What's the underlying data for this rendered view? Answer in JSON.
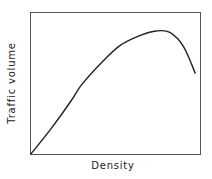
{
  "chart_data": {
    "type": "line",
    "title": "",
    "xlabel": "Density",
    "ylabel": "Traffic volume",
    "grid": false,
    "legend": null,
    "x_ticks": [],
    "y_ticks": [],
    "series": [
      {
        "name": "Traffic volume vs density",
        "x": [
          0,
          0.12,
          0.24,
          0.3,
          0.42,
          0.53,
          0.65,
          0.74,
          0.82,
          0.9,
          0.97
        ],
        "y": [
          0,
          0.18,
          0.38,
          0.49,
          0.65,
          0.77,
          0.84,
          0.87,
          0.86,
          0.76,
          0.57
        ]
      }
    ],
    "xlim": [
      0,
      1
    ],
    "ylim": [
      0,
      1
    ],
    "annotations": []
  },
  "colors": {
    "line": "#222222",
    "axis": "#555555",
    "background": "#ffffff"
  }
}
